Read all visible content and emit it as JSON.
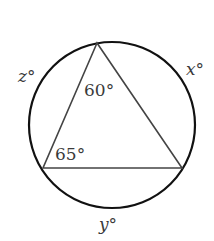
{
  "diagram": {
    "type": "circle-inscribed-triangle",
    "circle": {
      "cx": 112,
      "cy": 125,
      "r": 83,
      "stroke": "#111111",
      "stroke_width": 2.2
    },
    "triangle": {
      "vertices": {
        "top": [
          97,
          43
        ],
        "left": [
          43,
          168
        ],
        "right": [
          182,
          168
        ]
      },
      "stroke": "#444444",
      "stroke_width": 1.6
    },
    "angles": {
      "top": {
        "text": "60°",
        "value": 60,
        "x": 84,
        "y": 96
      },
      "left": {
        "text": "65°",
        "value": 65,
        "x": 55,
        "y": 160
      }
    },
    "arcs": {
      "z": {
        "text": "z°",
        "variable": "z",
        "x": 18,
        "y": 82
      },
      "x": {
        "text": "x°",
        "variable": "x",
        "x": 186,
        "y": 75
      },
      "y": {
        "text": "y°",
        "variable": "y",
        "x": 99,
        "y": 230
      }
    }
  }
}
